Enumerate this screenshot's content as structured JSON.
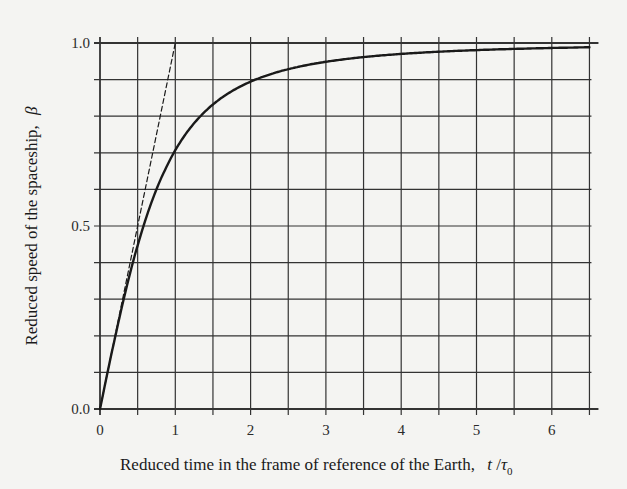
{
  "chart_data": {
    "type": "line",
    "title": "",
    "xlabel": "Reduced time in the frame of reference of the Earth,",
    "xlabel_symbol": "t / τ0",
    "ylabel": "Reduced speed of the spaceship,",
    "ylabel_symbol": "β",
    "xlim": [
      0,
      6.5
    ],
    "ylim": [
      0.0,
      1.0
    ],
    "x_ticks": [
      0,
      1,
      2,
      3,
      4,
      5,
      6
    ],
    "x_tick_labels": [
      "0",
      "1",
      "2",
      "3",
      "4",
      "5",
      "6"
    ],
    "x_minor_step": 0.5,
    "y_ticks": [
      0.0,
      0.5,
      1.0
    ],
    "y_tick_labels": [
      "0.0",
      "0.5",
      "1.0"
    ],
    "y_minor_step": 0.1,
    "grid": true,
    "legend": null,
    "series": [
      {
        "name": "Relativistic speed β = (t/τ0)/√(1+(t/τ0)²)",
        "style": "solid",
        "color": "#1a1a1a",
        "x": [
          0,
          0.25,
          0.5,
          0.75,
          1.0,
          1.25,
          1.5,
          2.0,
          2.5,
          3.0,
          3.5,
          4.0,
          4.5,
          5.0,
          5.5,
          6.0,
          6.5
        ],
        "y": [
          0.0,
          0.243,
          0.447,
          0.6,
          0.707,
          0.781,
          0.832,
          0.894,
          0.928,
          0.949,
          0.962,
          0.97,
          0.976,
          0.981,
          0.984,
          0.986,
          0.988
        ]
      },
      {
        "name": "Non-relativistic speed β = t/τ0",
        "style": "dashed",
        "color": "#1a1a1a",
        "x": [
          0,
          1.0
        ],
        "y": [
          0.0,
          1.0
        ]
      }
    ]
  }
}
